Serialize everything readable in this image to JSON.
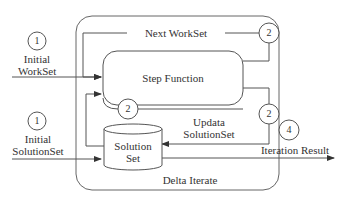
{
  "diagram": {
    "title": "Delta Iterate",
    "nodes": {
      "step_function": "Step Function",
      "solution_set_line1": "Solution",
      "solution_set_line2": "Set"
    },
    "labels": {
      "initial_workset_line1": "Initial",
      "initial_workset_line2": "WorkSet",
      "initial_solutionset_line1": "Initial",
      "initial_solutionset_line2": "SolutionSet",
      "next_workset": "Next WorkSet",
      "update_solutionset_line1": "Updata",
      "update_solutionset_line2": "SolutionSet",
      "iteration_result": "Iteration Result",
      "delta_iterate": "Delta Iterate"
    },
    "step_markers": {
      "initial_workset": "1",
      "initial_solutionset": "1",
      "next_workset": "2",
      "step_bottom": "2",
      "update_solutionset": "2",
      "iteration_result": "4"
    },
    "colors": {
      "line": "#555555",
      "text": "#333333"
    }
  }
}
